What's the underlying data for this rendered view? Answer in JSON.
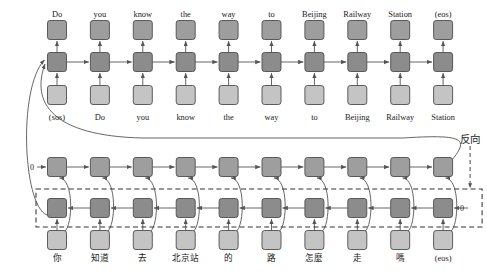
{
  "diagram": {
    "colors": {
      "cell_dark": "#8c8c8c",
      "cell_mid": "#9e9e9e",
      "cell_light": "#c4c4c4",
      "stroke": "#4d4d4d",
      "arrow": "#555555",
      "dashed": "#333333",
      "text": "#1a1a1a",
      "background": "#ffffff"
    },
    "decoder": {
      "outputs": [
        "Do",
        "you",
        "know",
        "the",
        "way",
        "to",
        "Beijing",
        "Railway",
        "Station",
        "(eos)"
      ],
      "inputs": [
        "(sos)",
        "Do",
        "you",
        "know",
        "the",
        "way",
        "to",
        "Beijing",
        "Railway",
        "Station"
      ]
    },
    "encoder": {
      "source_tokens": [
        "你",
        "知道",
        "去",
        "北京站",
        "的",
        "路",
        "怎麼",
        "走",
        "嗎",
        "(eos)"
      ],
      "forward_init_label": "0",
      "backward_init_label": "0",
      "reverse_label": "反向"
    },
    "layout": {
      "columns": 10,
      "col_first_x": 57,
      "col_spacing": 42.9,
      "box_size": 19,
      "row_y": {
        "decoder_output": 30,
        "decoder_cell": 62,
        "decoder_input": 95,
        "decoder_input_label": 117,
        "encoder_forward": 167,
        "encoder_backward": 208,
        "encoder_source": 240,
        "encoder_source_label": 261
      }
    }
  }
}
